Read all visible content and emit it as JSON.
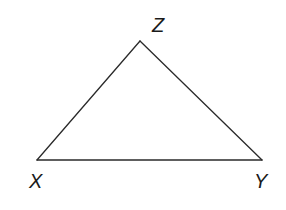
{
  "diagram": {
    "type": "triangle",
    "stroke_color": "#2a2a2a",
    "background": "#ffffff",
    "vertices": [
      {
        "name": "X",
        "label": "X",
        "x": 37,
        "y": 160
      },
      {
        "name": "Y",
        "label": "Y",
        "x": 262,
        "y": 160
      },
      {
        "name": "Z",
        "label": "Z",
        "x": 140,
        "y": 41
      }
    ],
    "sides": [
      {
        "name": "XY",
        "from": "X",
        "to": "Y"
      },
      {
        "name": "YZ",
        "from": "Y",
        "to": "Z"
      },
      {
        "name": "ZX",
        "from": "Z",
        "to": "X"
      }
    ]
  },
  "labels": {
    "x": "X",
    "y": "Y",
    "z": "Z"
  }
}
